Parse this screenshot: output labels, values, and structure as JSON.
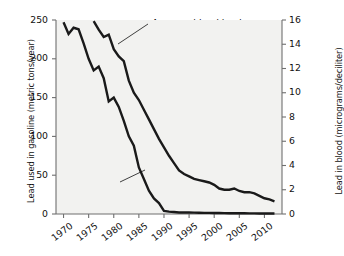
{
  "chart_data": {
    "type": "line",
    "title": "",
    "xlabel": "",
    "ylabel": "Lead used in gasoline (metric tons/year)",
    "ylabel_right": "Lead in blood (micrograms/deciliter)",
    "xlim": [
      1968.5,
      2013.5
    ],
    "ylim": [
      0,
      250
    ],
    "ylim_right": [
      0,
      16
    ],
    "grid": false,
    "legend_position": "inline-annotations",
    "xticks": [
      1970,
      1975,
      1980,
      1985,
      1990,
      1995,
      2000,
      2005,
      2010
    ],
    "xtick_labels": [
      "1970",
      "1975",
      "1980",
      "1985",
      "1990",
      "1995",
      "2000",
      "2005",
      "2010"
    ],
    "yticks_left": [
      0,
      50,
      100,
      150,
      200,
      250
    ],
    "ytick_labels_left": [
      "0",
      "50",
      "100",
      "150",
      "200",
      "250"
    ],
    "yticks_right": [
      0,
      2,
      4,
      6,
      8,
      10,
      12,
      14,
      16
    ],
    "ytick_labels_right": [
      "0",
      "2",
      "4",
      "6",
      "8",
      "10",
      "12",
      "14",
      "16"
    ],
    "series": [
      {
        "name": "Lead used in gasoline",
        "axis": "left",
        "units": "metric tons/year",
        "x": [
          1970,
          1971,
          1972,
          1973,
          1974,
          1975,
          1976,
          1977,
          1978,
          1979,
          1980,
          1981,
          1982,
          1983,
          1984,
          1985,
          1986,
          1987,
          1988,
          1989,
          1990,
          1991,
          1992,
          1993,
          1994,
          1995,
          1996,
          1997,
          1998,
          1999,
          2000,
          2001,
          2002,
          2003,
          2004,
          2005,
          2006,
          2007,
          2008,
          2009,
          2010,
          2011,
          2012
        ],
        "values": [
          247,
          232,
          240,
          238,
          220,
          200,
          185,
          190,
          175,
          145,
          150,
          138,
          120,
          100,
          88,
          60,
          45,
          30,
          20,
          14,
          4,
          3,
          2.5,
          2,
          2,
          2,
          1.8,
          1.6,
          1.5,
          1.4,
          1.3,
          1.2,
          1.1,
          1.0,
          1.0,
          0.9,
          0.9,
          0.8,
          0.8,
          0.7,
          0.7,
          0.6,
          0.6
        ]
      },
      {
        "name": "Average blood lead concentration",
        "axis": "right",
        "units": "micrograms/deciliter",
        "x": [
          1976,
          1977,
          1978,
          1979,
          1980,
          1981,
          1982,
          1983,
          1984,
          1985,
          1986,
          1987,
          1988,
          1989,
          1990,
          1991,
          1992,
          1993,
          1994,
          1995,
          1996,
          1997,
          1998,
          1999,
          2000,
          2001,
          2002,
          2003,
          2004,
          2005,
          2006,
          2007,
          2008,
          2009,
          2010,
          2011,
          2012
        ],
        "values": [
          15.9,
          15.2,
          14.6,
          14.8,
          13.6,
          13.0,
          12.6,
          11.0,
          10.0,
          9.4,
          8.6,
          7.8,
          7.0,
          6.2,
          5.5,
          4.8,
          4.2,
          3.6,
          3.3,
          3.1,
          2.9,
          2.8,
          2.7,
          2.6,
          2.4,
          2.1,
          2.0,
          2.0,
          2.1,
          1.9,
          1.8,
          1.8,
          1.7,
          1.5,
          1.3,
          1.2,
          1.05
        ]
      }
    ],
    "annotations": [
      {
        "id": "blood",
        "text_lines": [
          "Average blood lead",
          "concentration"
        ],
        "points_to_series": "Average blood lead concentration"
      },
      {
        "id": "gasoline",
        "text_lines": [
          "Lead used",
          "in gasoline"
        ],
        "points_to_series": "Lead used in gasoline"
      }
    ]
  },
  "colors": {
    "line": "#1a1a1a",
    "axis": "#6f6f6f",
    "text": "#111111",
    "background": "#ffffff",
    "plot_background": "#f2f2f0"
  }
}
